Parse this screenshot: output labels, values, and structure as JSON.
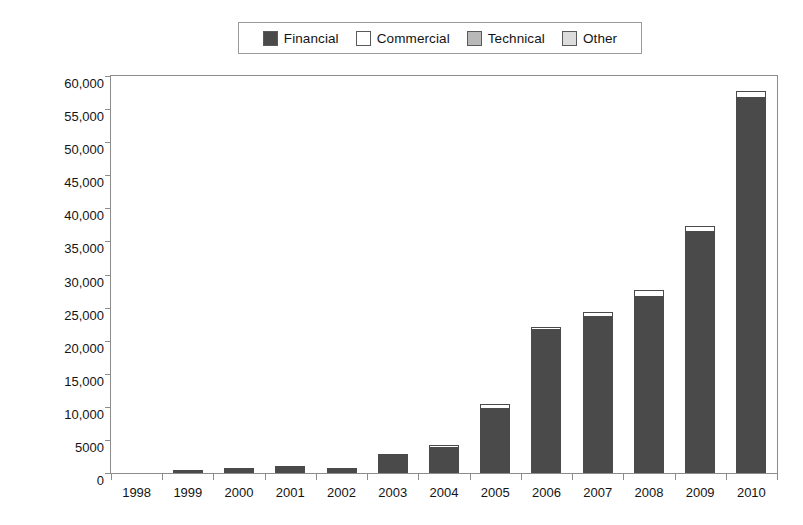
{
  "legend": {
    "position": "top-center",
    "entries": [
      {
        "label": "Financial",
        "color": "#4a4a4a",
        "icon": "legend-swatch-icon"
      },
      {
        "label": "Commercial",
        "color": "#ffffff",
        "icon": "legend-swatch-icon"
      },
      {
        "label": "Technical",
        "color": "#b8b8b8",
        "icon": "legend-swatch-icon"
      },
      {
        "label": "Other",
        "color": "#dcdcdc",
        "icon": "legend-swatch-icon"
      }
    ]
  },
  "chart_data": {
    "type": "bar",
    "title": "",
    "xlabel": "",
    "ylabel": "",
    "stacked": true,
    "grid": false,
    "ylim": [
      0,
      60000
    ],
    "ytick_values": [
      0,
      5000,
      10000,
      15000,
      20000,
      25000,
      30000,
      35000,
      40000,
      45000,
      50000,
      55000,
      60000
    ],
    "ytick_labels": [
      "0",
      "5000",
      "10,000",
      "15,000",
      "20,000",
      "25,000",
      "30,000",
      "35,000",
      "40,000",
      "45,000",
      "50,000",
      "55,000",
      "60,000"
    ],
    "categories": [
      "1998",
      "1999",
      "2000",
      "2001",
      "2002",
      "2003",
      "2004",
      "2005",
      "2006",
      "2007",
      "2008",
      "2009",
      "2010"
    ],
    "series": [
      {
        "name": "Financial",
        "color": "#4a4a4a",
        "values": [
          0,
          500,
          700,
          1100,
          800,
          2800,
          4000,
          9900,
          21700,
          23800,
          26800,
          36600,
          56800
        ]
      },
      {
        "name": "Commercial",
        "color": "#ffffff",
        "values": [
          0,
          0,
          0,
          0,
          0,
          0,
          200,
          500,
          400,
          500,
          900,
          800,
          1000
        ]
      },
      {
        "name": "Technical",
        "color": "#b8b8b8",
        "values": [
          0,
          0,
          0,
          0,
          0,
          0,
          0,
          0,
          0,
          0,
          0,
          0,
          0
        ]
      },
      {
        "name": "Other",
        "color": "#dcdcdc",
        "values": [
          0,
          0,
          0,
          0,
          0,
          0,
          0,
          0,
          0,
          0,
          0,
          0,
          0
        ]
      }
    ],
    "totals": [
      0,
      500,
      700,
      1100,
      800,
      2800,
      4200,
      10400,
      22100,
      24300,
      27700,
      37400,
      57800
    ]
  }
}
